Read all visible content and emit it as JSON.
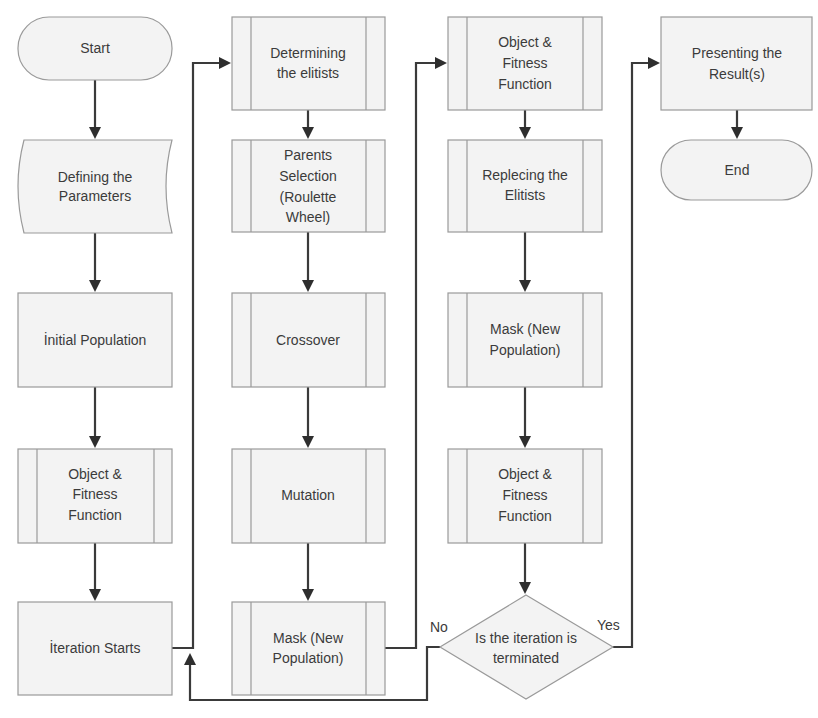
{
  "diagram": {
    "type": "flowchart",
    "nodes": [
      {
        "id": "start",
        "shape": "terminator",
        "lines": [
          "Start"
        ]
      },
      {
        "id": "params",
        "shape": "data",
        "lines": [
          "Defining the",
          "Parameters"
        ]
      },
      {
        "id": "init_pop",
        "shape": "process",
        "lines": [
          "İnitial Population"
        ]
      },
      {
        "id": "fitness1",
        "shape": "predefined-process",
        "lines": [
          "Object &",
          "Fitness",
          "Function"
        ]
      },
      {
        "id": "iter_start",
        "shape": "process",
        "lines": [
          "İteration Starts"
        ]
      },
      {
        "id": "elitists",
        "shape": "predefined-process",
        "lines": [
          "Determining",
          "the elitists"
        ]
      },
      {
        "id": "parents",
        "shape": "predefined-process",
        "lines": [
          "Parents",
          "Selection",
          "(Roulette",
          "Wheel)"
        ]
      },
      {
        "id": "crossover",
        "shape": "predefined-process",
        "lines": [
          "Crossover"
        ]
      },
      {
        "id": "mutation",
        "shape": "predefined-process",
        "lines": [
          "Mutation"
        ]
      },
      {
        "id": "mask1",
        "shape": "predefined-process",
        "lines": [
          "Mask (New",
          "Population)"
        ]
      },
      {
        "id": "fitness2",
        "shape": "predefined-process",
        "lines": [
          "Object &",
          "Fitness",
          "Function"
        ]
      },
      {
        "id": "replace",
        "shape": "predefined-process",
        "lines": [
          "Replecing the",
          "Elitists"
        ]
      },
      {
        "id": "mask2",
        "shape": "predefined-process",
        "lines": [
          "Mask (New",
          "Population)"
        ]
      },
      {
        "id": "fitness3",
        "shape": "predefined-process",
        "lines": [
          "Object &",
          "Fitness",
          "Function"
        ]
      },
      {
        "id": "decision",
        "shape": "decision",
        "lines": [
          "Is the iteration is",
          "terminated"
        ]
      },
      {
        "id": "present",
        "shape": "process",
        "lines": [
          "Presenting the",
          "Result(s)"
        ]
      },
      {
        "id": "end",
        "shape": "terminator",
        "lines": [
          "End"
        ]
      }
    ],
    "edges": [
      {
        "from": "start",
        "to": "params"
      },
      {
        "from": "params",
        "to": "init_pop"
      },
      {
        "from": "init_pop",
        "to": "fitness1"
      },
      {
        "from": "fitness1",
        "to": "iter_start"
      },
      {
        "from": "iter_start",
        "to": "elitists"
      },
      {
        "from": "elitists",
        "to": "parents"
      },
      {
        "from": "parents",
        "to": "crossover"
      },
      {
        "from": "crossover",
        "to": "mutation"
      },
      {
        "from": "mutation",
        "to": "mask1"
      },
      {
        "from": "mask1",
        "to": "fitness2"
      },
      {
        "from": "fitness2",
        "to": "replace"
      },
      {
        "from": "replace",
        "to": "mask2"
      },
      {
        "from": "mask2",
        "to": "fitness3"
      },
      {
        "from": "fitness3",
        "to": "decision"
      },
      {
        "from": "decision",
        "to": "iter_start",
        "label": "No"
      },
      {
        "from": "decision",
        "to": "present",
        "label": "Yes"
      },
      {
        "from": "present",
        "to": "end"
      }
    ],
    "branch_labels": {
      "no": "No",
      "yes": "Yes"
    },
    "colors": {
      "fill": "#f3f3f3",
      "stroke": "#9a9a9a",
      "connector": "#3a3a3a",
      "text": "#3b3b3b"
    }
  }
}
